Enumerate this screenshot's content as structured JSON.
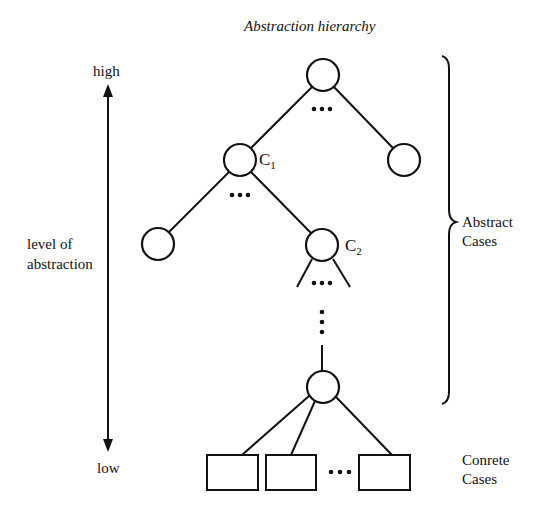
{
  "title": "Abstraction hierarchy",
  "axis": {
    "high_label": "high",
    "low_label": "low",
    "label_line1": "level of",
    "label_line2": "abstraction"
  },
  "nodes": {
    "c1": {
      "letter": "C",
      "sub": "1"
    },
    "c2": {
      "letter": "C",
      "sub": "2"
    }
  },
  "ellipsis": "•••",
  "brace_labels": {
    "abstract_line1": "Abstract",
    "abstract_line2": "Cases",
    "concrete_line1": "Conrete",
    "concrete_line2": "Cases"
  },
  "colors": {
    "stroke": "#111111",
    "background": "#ffffff"
  }
}
